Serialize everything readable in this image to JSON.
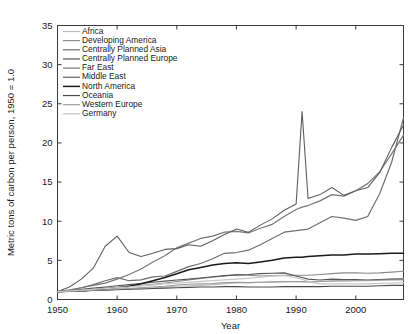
{
  "chart_data": {
    "type": "line",
    "title": "",
    "xlabel": "Year",
    "ylabel": "Metric tons of carbon per person, 1950 = 1.0",
    "xlim": [
      1950,
      2008
    ],
    "ylim": [
      0,
      35
    ],
    "xticks": [
      1950,
      1960,
      1970,
      1980,
      1990,
      2000
    ],
    "yticks": [
      0,
      5,
      10,
      15,
      20,
      25,
      30,
      35
    ],
    "grid": false,
    "legend_position": "upper-left-inside",
    "x": [
      1950,
      1952,
      1954,
      1956,
      1958,
      1960,
      1962,
      1964,
      1966,
      1968,
      1970,
      1972,
      1974,
      1976,
      1978,
      1980,
      1982,
      1984,
      1986,
      1988,
      1990,
      1991,
      1992,
      1994,
      1996,
      1998,
      2000,
      2002,
      2004,
      2006,
      2008
    ],
    "series": [
      {
        "name": "Africa",
        "color": "#bdbdbd",
        "width": 1.1,
        "values": [
          1.0,
          1.05,
          1.1,
          1.15,
          1.2,
          1.3,
          1.35,
          1.45,
          1.5,
          1.6,
          1.7,
          1.75,
          1.8,
          1.9,
          2.0,
          2.1,
          2.15,
          2.2,
          2.2,
          2.25,
          2.25,
          2.25,
          2.25,
          2.3,
          2.3,
          2.35,
          2.4,
          2.45,
          2.5,
          2.6,
          2.7
        ]
      },
      {
        "name": "Developing America",
        "color": "#8c8c8c",
        "width": 1.1,
        "values": [
          1.0,
          1.1,
          1.2,
          1.3,
          1.45,
          1.55,
          1.65,
          1.8,
          1.95,
          2.1,
          2.3,
          2.5,
          2.7,
          2.85,
          3.0,
          3.15,
          3.1,
          3.0,
          3.05,
          3.1,
          3.1,
          3.1,
          3.1,
          3.2,
          3.3,
          3.4,
          3.4,
          3.35,
          3.4,
          3.5,
          3.6
        ]
      },
      {
        "name": "Centrally Planned Asia",
        "color": "#6e6e6e",
        "width": 1.2,
        "values": [
          1.0,
          1.2,
          1.5,
          1.9,
          2.4,
          2.8,
          2.4,
          2.5,
          2.9,
          3.0,
          3.6,
          4.2,
          4.6,
          5.2,
          5.9,
          6.0,
          6.3,
          7.0,
          7.8,
          8.6,
          8.8,
          8.9,
          9.0,
          9.8,
          10.6,
          10.4,
          10.1,
          10.6,
          13.5,
          17.5,
          23.2
        ]
      },
      {
        "name": "Centrally Planned Europe",
        "color": "#555555",
        "width": 1.1,
        "values": [
          1.0,
          1.15,
          1.3,
          1.45,
          1.6,
          1.75,
          1.9,
          2.05,
          2.2,
          2.35,
          2.5,
          2.6,
          2.75,
          2.9,
          3.05,
          3.15,
          3.2,
          3.3,
          3.35,
          3.4,
          3.0,
          2.8,
          2.6,
          2.5,
          2.6,
          2.55,
          2.55,
          2.5,
          2.55,
          2.6,
          2.6
        ]
      },
      {
        "name": "Far East",
        "color": "#777777",
        "width": 1.2,
        "values": [
          1.0,
          1.2,
          1.5,
          1.8,
          2.1,
          2.6,
          3.2,
          3.9,
          4.8,
          5.6,
          6.6,
          7.2,
          7.8,
          8.1,
          8.6,
          8.7,
          8.5,
          9.1,
          9.6,
          10.6,
          11.5,
          11.8,
          12.0,
          12.6,
          13.4,
          13.2,
          13.9,
          14.8,
          16.3,
          18.6,
          21.0
        ]
      },
      {
        "name": "Middle East",
        "color": "#5e5e5e",
        "width": 1.1,
        "values": [
          1.0,
          1.6,
          2.6,
          4.0,
          6.8,
          8.1,
          6.0,
          5.5,
          5.9,
          6.4,
          6.5,
          7.0,
          6.8,
          7.5,
          8.3,
          9.0,
          8.6,
          9.5,
          10.3,
          11.4,
          12.2,
          24.0,
          12.9,
          13.4,
          14.3,
          13.3,
          13.9,
          14.3,
          16.2,
          19.4,
          22.3
        ]
      },
      {
        "name": "North America",
        "color": "#1a1a1a",
        "width": 1.5,
        "values": [
          1.0,
          1.05,
          1.1,
          1.2,
          1.3,
          1.5,
          1.7,
          2.0,
          2.4,
          2.8,
          3.3,
          3.8,
          4.1,
          4.4,
          4.6,
          4.7,
          4.6,
          4.8,
          5.0,
          5.3,
          5.4,
          5.4,
          5.5,
          5.6,
          5.7,
          5.7,
          5.8,
          5.8,
          5.85,
          5.9,
          5.9
        ]
      },
      {
        "name": "Oceania",
        "color": "#4a4a4a",
        "width": 1.1,
        "values": [
          1.0,
          1.05,
          1.1,
          1.15,
          1.2,
          1.25,
          1.3,
          1.35,
          1.4,
          1.45,
          1.5,
          1.55,
          1.6,
          1.6,
          1.65,
          1.65,
          1.6,
          1.6,
          1.6,
          1.65,
          1.65,
          1.65,
          1.65,
          1.65,
          1.7,
          1.7,
          1.7,
          1.7,
          1.75,
          1.8,
          1.8
        ]
      },
      {
        "name": "Western Europe",
        "color": "#9a9a9a",
        "width": 1.1,
        "values": [
          1.0,
          1.05,
          1.1,
          1.2,
          1.25,
          1.35,
          1.4,
          1.5,
          1.6,
          1.7,
          1.85,
          1.95,
          2.0,
          2.05,
          2.15,
          2.2,
          2.15,
          2.2,
          2.25,
          2.3,
          2.3,
          2.3,
          2.25,
          2.3,
          2.4,
          2.4,
          2.4,
          2.4,
          2.45,
          2.5,
          2.5
        ]
      },
      {
        "name": "Germany",
        "color": "#c8c8c8",
        "width": 1.3,
        "values": [
          1.0,
          1.1,
          1.2,
          1.3,
          1.4,
          1.5,
          1.6,
          1.75,
          1.85,
          2.0,
          2.1,
          2.2,
          2.3,
          2.4,
          2.5,
          2.6,
          2.7,
          2.85,
          3.0,
          3.05,
          2.8,
          2.6,
          2.3,
          2.0,
          2.0,
          2.0,
          2.0,
          2.0,
          2.05,
          2.1,
          2.15
        ]
      }
    ]
  },
  "axis": {
    "ylabel": "Metric tons of carbon per person, 1950 = 1.0",
    "xlabel": "Year"
  }
}
